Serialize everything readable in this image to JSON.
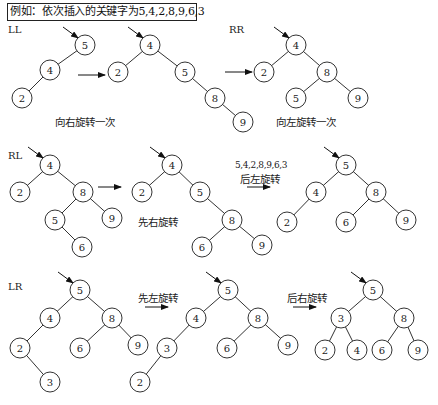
{
  "title": "例如：依次插入的关键字为5,4,2,8,9,6,3",
  "sections": [
    {
      "label": "LL",
      "trees": [
        {
          "nodes": [
            {
              "id": "a",
              "v": "5"
            },
            {
              "id": "b",
              "v": "4"
            },
            {
              "id": "c",
              "v": "2"
            }
          ],
          "edges": [
            [
              "a",
              "b"
            ],
            [
              "b",
              "c"
            ]
          ],
          "root": "a"
        },
        {
          "nodes": [
            {
              "id": "a",
              "v": "4"
            },
            {
              "id": "b",
              "v": "2"
            },
            {
              "id": "c",
              "v": "5"
            },
            {
              "id": "d",
              "v": "8"
            },
            {
              "id": "e",
              "v": "9"
            }
          ],
          "edges": [
            [
              "a",
              "b"
            ],
            [
              "a",
              "c"
            ],
            [
              "c",
              "d"
            ],
            [
              "d",
              "e"
            ]
          ],
          "root": "a"
        }
      ],
      "caption": "向右旋转一次"
    },
    {
      "label": "RR",
      "trees": [
        {
          "nodes": [
            {
              "id": "a",
              "v": "4"
            },
            {
              "id": "b",
              "v": "2"
            },
            {
              "id": "c",
              "v": "8"
            },
            {
              "id": "d",
              "v": "5"
            },
            {
              "id": "e",
              "v": "9"
            }
          ],
          "edges": [
            [
              "a",
              "b"
            ],
            [
              "a",
              "c"
            ],
            [
              "c",
              "d"
            ],
            [
              "c",
              "e"
            ]
          ],
          "root": "a"
        }
      ],
      "caption": "向左旋转一次"
    },
    {
      "label": "RL",
      "trees": [
        {
          "nodes": [
            {
              "id": "a",
              "v": "4"
            },
            {
              "id": "b",
              "v": "2"
            },
            {
              "id": "c",
              "v": "8"
            },
            {
              "id": "d",
              "v": "5"
            },
            {
              "id": "e",
              "v": "9"
            },
            {
              "id": "f",
              "v": "6"
            }
          ],
          "edges": [
            [
              "a",
              "b"
            ],
            [
              "a",
              "c"
            ],
            [
              "c",
              "d"
            ],
            [
              "c",
              "e"
            ],
            [
              "d",
              "f"
            ]
          ],
          "root": "a"
        },
        {
          "nodes": [
            {
              "id": "a",
              "v": "4"
            },
            {
              "id": "b",
              "v": "2"
            },
            {
              "id": "c",
              "v": "5"
            },
            {
              "id": "d",
              "v": "8"
            },
            {
              "id": "e",
              "v": "6"
            },
            {
              "id": "f",
              "v": "9"
            }
          ],
          "edges": [
            [
              "a",
              "b"
            ],
            [
              "a",
              "c"
            ],
            [
              "c",
              "d"
            ],
            [
              "d",
              "e"
            ],
            [
              "d",
              "f"
            ]
          ],
          "root": "a"
        },
        {
          "nodes": [
            {
              "id": "a",
              "v": "5"
            },
            {
              "id": "b",
              "v": "4"
            },
            {
              "id": "c",
              "v": "8"
            },
            {
              "id": "d",
              "v": "2"
            },
            {
              "id": "e",
              "v": "6"
            },
            {
              "id": "f",
              "v": "9"
            }
          ],
          "edges": [
            [
              "a",
              "b"
            ],
            [
              "a",
              "c"
            ],
            [
              "b",
              "d"
            ],
            [
              "c",
              "e"
            ],
            [
              "c",
              "f"
            ]
          ],
          "root": "a"
        }
      ],
      "caption_first": "先右旋转",
      "sequence_note": "5,4,2,8,9,6,3",
      "caption_second": "后左旋转"
    },
    {
      "label": "LR",
      "trees": [
        {
          "nodes": [
            {
              "id": "a",
              "v": "5"
            },
            {
              "id": "b",
              "v": "4"
            },
            {
              "id": "c",
              "v": "8"
            },
            {
              "id": "d",
              "v": "2"
            },
            {
              "id": "e",
              "v": "6"
            },
            {
              "id": "f",
              "v": "9"
            },
            {
              "id": "g",
              "v": "3"
            }
          ],
          "edges": [
            [
              "a",
              "b"
            ],
            [
              "a",
              "c"
            ],
            [
              "b",
              "d"
            ],
            [
              "c",
              "e"
            ],
            [
              "c",
              "f"
            ],
            [
              "d",
              "g"
            ]
          ],
          "root": "a"
        },
        {
          "nodes": [
            {
              "id": "a",
              "v": "5"
            },
            {
              "id": "b",
              "v": "4"
            },
            {
              "id": "c",
              "v": "8"
            },
            {
              "id": "d",
              "v": "3"
            },
            {
              "id": "e",
              "v": "6"
            },
            {
              "id": "f",
              "v": "9"
            },
            {
              "id": "g",
              "v": "2"
            }
          ],
          "edges": [
            [
              "a",
              "b"
            ],
            [
              "a",
              "c"
            ],
            [
              "b",
              "d"
            ],
            [
              "c",
              "e"
            ],
            [
              "c",
              "f"
            ],
            [
              "d",
              "g"
            ]
          ],
          "root": "a"
        },
        {
          "nodes": [
            {
              "id": "a",
              "v": "5"
            },
            {
              "id": "b",
              "v": "3"
            },
            {
              "id": "c",
              "v": "8"
            },
            {
              "id": "d",
              "v": "2"
            },
            {
              "id": "e",
              "v": "4"
            },
            {
              "id": "f",
              "v": "6"
            },
            {
              "id": "g",
              "v": "9"
            }
          ],
          "edges": [
            [
              "a",
              "b"
            ],
            [
              "a",
              "c"
            ],
            [
              "b",
              "d"
            ],
            [
              "b",
              "e"
            ],
            [
              "c",
              "f"
            ],
            [
              "c",
              "g"
            ]
          ],
          "root": "a"
        }
      ],
      "caption_first": "先左旋转",
      "caption_second": "后右旋转"
    }
  ]
}
